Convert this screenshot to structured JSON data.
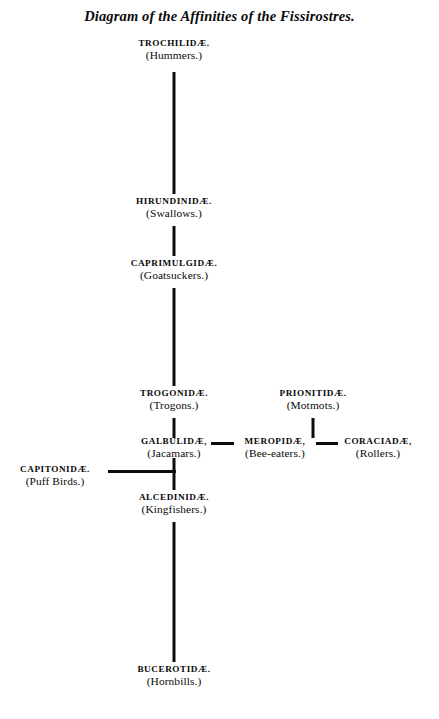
{
  "title": "Diagram of the Affinities of the Fissirostres.",
  "nodes": {
    "trochilidae": {
      "family": "TROCHILIDÆ.",
      "common": "(Hummers.)"
    },
    "hirundinidae": {
      "family": "HIRUNDINIDÆ.",
      "common": "(Swallows.)"
    },
    "caprimulgidae": {
      "family": "CAPRIMULGIDÆ.",
      "common": "(Goatsuckers.)"
    },
    "trogonidae": {
      "family": "TROGONIDÆ.",
      "common": "(Trogons.)"
    },
    "prionitidae": {
      "family": "PRIONITIDÆ.",
      "common": "(Motmots.)"
    },
    "galbulidae": {
      "family": "GALBULIDÆ,",
      "common": "(Jacamars.)"
    },
    "meropidae": {
      "family": "MEROPIDÆ,",
      "common": "(Bee-eaters.)"
    },
    "coraciadae": {
      "family": "CORACIADÆ,",
      "common": "(Rollers.)"
    },
    "capitonidae": {
      "family": "CAPITONIDÆ.",
      "common": "(Puff Birds.)"
    },
    "alcedinidae": {
      "family": "ALCEDINIDÆ.",
      "common": "(Kingfishers.)"
    },
    "bucerotidae": {
      "family": "BUCEROTIDÆ.",
      "common": "(Hornbills.)"
    }
  },
  "colors": {
    "ink": "#0d0d0d",
    "page": "#ffffff"
  }
}
